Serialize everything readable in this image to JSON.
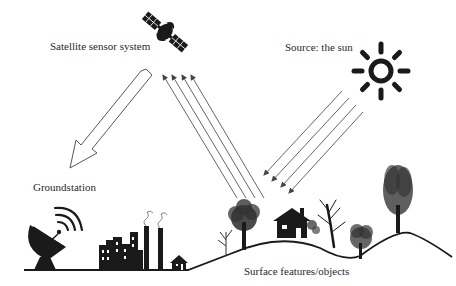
{
  "diagram": {
    "labels": {
      "satellite": "Satellite sensor system",
      "sun": "Source: the sun",
      "groundstation": "Groundstation",
      "surface": "Surface features/objects"
    },
    "nodes": [
      {
        "id": "satellite",
        "icon": "satellite-icon",
        "label": "Satellite sensor system"
      },
      {
        "id": "sun",
        "icon": "sun-icon",
        "label": "Source: the sun"
      },
      {
        "id": "groundstation",
        "icon": "satellite-dish-icon",
        "label": "Groundstation"
      },
      {
        "id": "surface",
        "icon": "landscape-icon",
        "label": "Surface features/objects"
      }
    ],
    "edges": [
      {
        "from": "sun",
        "to": "surface",
        "style": "4 thin parallel arrows",
        "meaning": "incident solar radiation"
      },
      {
        "from": "surface",
        "to": "satellite",
        "style": "4 thin parallel arrows",
        "meaning": "reflected radiation"
      },
      {
        "from": "satellite",
        "to": "groundstation",
        "style": "large hollow arrow",
        "meaning": "data transmission"
      }
    ],
    "colors": {
      "ink": "#1a1a1a",
      "ray": "#555555",
      "text": "#2a2a2a",
      "background": "#ffffff"
    }
  }
}
